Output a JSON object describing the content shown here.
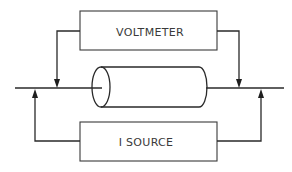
{
  "diagram": {
    "type": "four-point-probe measurement schematic",
    "voltmeter": {
      "label": "VOLTMETER"
    },
    "current_source": {
      "label": "I SOURCE"
    },
    "sample": {
      "shape": "cylinder"
    },
    "colors": {
      "line": "#2a2a2a",
      "text": "#3a3a3a",
      "background": "#ffffff"
    }
  }
}
